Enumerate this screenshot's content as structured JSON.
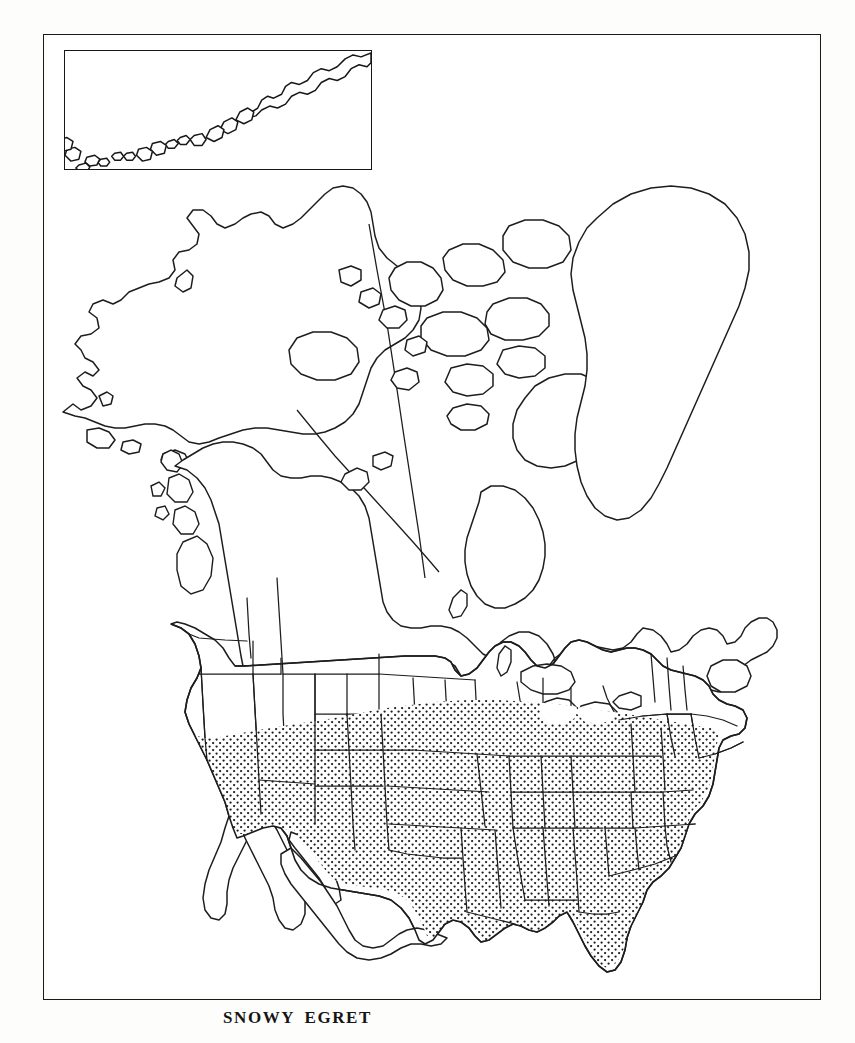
{
  "document": {
    "caption": "SNOWY EGRET",
    "kind": "species-range-map",
    "region": "North America"
  },
  "frame": {
    "style": "double-rule-border",
    "line_color": "#1a1a1a",
    "background_color": "#fdfdfc"
  },
  "inset": {
    "name": "aleutian-islands-inset",
    "label": "",
    "border_color": "#171717"
  },
  "legend": {
    "shaded_meaning": "breeding-range",
    "shading_style": "stipple-dots",
    "stipple_color": "#1c1c1c"
  },
  "map": {
    "outline_color": "#1d1d1d",
    "fill_color": "#ffffff",
    "features": [
      "alaska",
      "canada",
      "greenland",
      "united-states",
      "mexico",
      "baja-california",
      "great-lakes",
      "newfoundland",
      "nova-scotia",
      "florida-peninsula"
    ],
    "shaded_states": [
      "California (Central Valley)",
      "Arizona",
      "New Mexico",
      "Colorado",
      "Kansas",
      "Missouri",
      "Oklahoma",
      "Texas",
      "Arkansas",
      "Louisiana",
      "Mississippi",
      "Alabama",
      "Tennessee",
      "Kentucky",
      "Illinois",
      "Indiana",
      "Ohio",
      "West Virginia",
      "Virginia",
      "Maryland",
      "Delaware",
      "New Jersey",
      "Pennsylvania",
      "North Carolina",
      "South Carolina",
      "Georgia",
      "Florida"
    ]
  }
}
